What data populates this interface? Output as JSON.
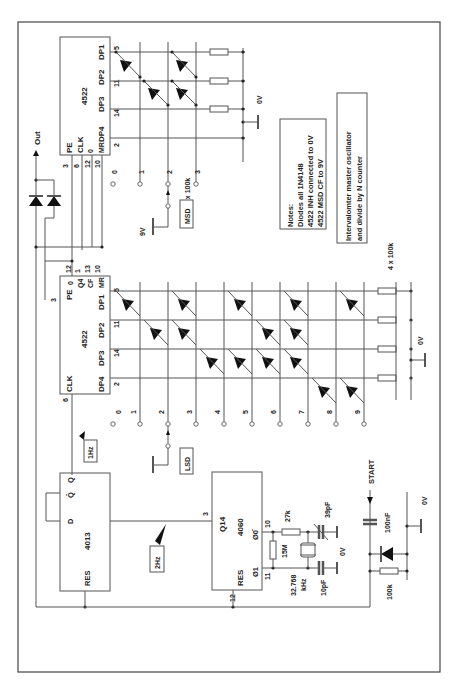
{
  "diagram": {
    "orientation": "rotated-90-ccw",
    "ics": {
      "msd_counter": {
        "part": "4522",
        "pins_left": [
          "PE",
          "CLK",
          "0",
          "MR"
        ],
        "pin_numbers_left": [
          "3",
          "6",
          "12",
          "10"
        ],
        "outputs": [
          "DP4",
          "DP3",
          "DP2",
          "DP1"
        ],
        "output_pins": [
          "2",
          "14",
          "11",
          "5"
        ]
      },
      "lsd_counter": {
        "part": "4522",
        "pins": [
          "PE",
          "0",
          "Q4",
          "CF",
          "MR"
        ],
        "pin_numbers": [
          "3",
          "12",
          "1",
          "13",
          "10"
        ],
        "clk_label": "CLK",
        "clk_pin": "6",
        "outputs": [
          "DP4",
          "DP3",
          "DP2",
          "DP1"
        ],
        "output_pins": [
          "2",
          "14",
          "11",
          "5"
        ]
      },
      "flipflop": {
        "part": "4013",
        "pins": [
          "D",
          "Q̄",
          "Q",
          "RES"
        ]
      },
      "oscillator": {
        "part": "4060",
        "pins": [
          "Q14",
          "RES",
          "Ø1",
          "Ø0̄"
        ],
        "pin_numbers": [
          "3",
          "12",
          "11",
          "10"
        ]
      }
    },
    "labels": {
      "out": "Out",
      "msd": "MSD",
      "lsd": "LSD",
      "hz1": "1Hz",
      "hz2": "2Hz",
      "v9": "9V",
      "v0": "0V",
      "start": "START",
      "res_msd": "3 x 100k",
      "res_lsd": "4 x 100k",
      "r27k": "27k",
      "r15m": "15M",
      "c39p": "39pF",
      "c10p": "10pF",
      "xtal": "32.768",
      "xtal_unit": "kHz",
      "c100n": "100nF",
      "r100k": "100k"
    },
    "switch_positions_msd": [
      "0",
      "1",
      "2",
      "3"
    ],
    "switch_positions_lsd": [
      "0",
      "1",
      "2",
      "3",
      "4",
      "5",
      "6",
      "7",
      "8",
      "9"
    ],
    "notes": {
      "title": "Notes:",
      "lines": [
        "Diodes all 1N4148",
        "4522 INH connected to 0V",
        "4522 MSD CF to 9V"
      ]
    },
    "caption": {
      "lines": [
        "Intervalomter master oscillator",
        "and divide by N counter"
      ]
    }
  }
}
